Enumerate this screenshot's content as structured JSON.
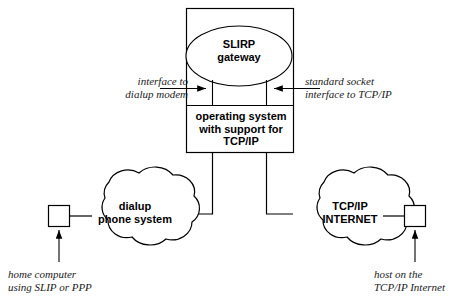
{
  "diagram": {
    "stroke_color": "#000000",
    "background_color": "#ffffff",
    "nodes": {
      "gateway_ellipse": {
        "label": "SLIRP\ngateway"
      },
      "os_box": {
        "label": "operating system\nwith support for\nTCP/IP"
      },
      "cloud_left": {
        "label": "dialup\nphone system"
      },
      "cloud_right": {
        "label": "TCP/IP\nINTERNET"
      },
      "host_left_square": {
        "label": ""
      },
      "host_right_square": {
        "label": ""
      }
    },
    "annotations": {
      "left_interface": "interface to\ndialup modem",
      "right_interface": "standard socket\ninterface to TCP/IP",
      "left_caption": "home computer\nusing SLIP or PPP",
      "right_caption": "host on the\nTCP/IP Internet"
    }
  }
}
